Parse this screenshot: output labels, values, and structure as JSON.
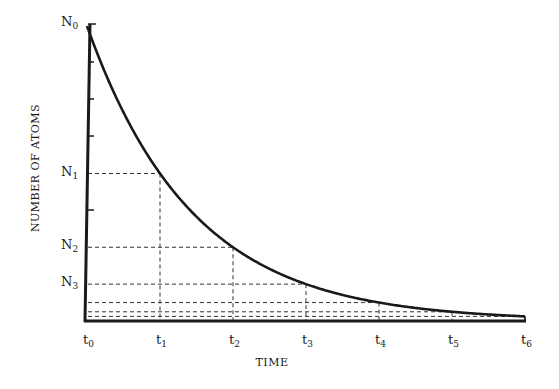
{
  "chart_data": {
    "type": "line",
    "title": "",
    "xlabel": "TIME",
    "ylabel": "NUMBER OF ATOMS",
    "x_ticks": [
      {
        "base": "t",
        "sub": "0"
      },
      {
        "base": "t",
        "sub": "1"
      },
      {
        "base": "t",
        "sub": "2"
      },
      {
        "base": "t",
        "sub": "3"
      },
      {
        "base": "t",
        "sub": "4"
      },
      {
        "base": "t",
        "sub": "5"
      },
      {
        "base": "t",
        "sub": "6"
      }
    ],
    "y_ticks": [
      {
        "base": "N",
        "sub": "0"
      },
      {
        "base": "N",
        "sub": "1"
      },
      {
        "base": "N",
        "sub": "2"
      },
      {
        "base": "N",
        "sub": "3"
      }
    ],
    "series": [
      {
        "name": "Radioactive decay curve",
        "x": [
          0,
          1,
          2,
          3,
          4,
          5,
          6
        ],
        "values": [
          1.0,
          0.5,
          0.25,
          0.125,
          0.0625,
          0.03125,
          0.015625
        ]
      }
    ],
    "ylim": [
      0,
      1
    ],
    "xlim": [
      0,
      6
    ],
    "grid": false,
    "annotations": "Dashed guide lines drop from the curve at each t_n to the axes; curve halves every interval (half-life)."
  },
  "colors": {
    "ink": "#1a1a1a",
    "background": "#ffffff"
  }
}
